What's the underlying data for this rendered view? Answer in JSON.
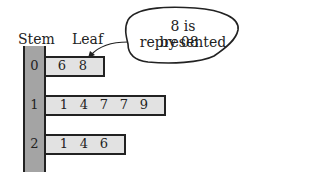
{
  "headers": {
    "stem": "Stem",
    "leaf": "Leaf"
  },
  "rows": [
    {
      "stem": "0",
      "leaves": [
        "6",
        "8"
      ]
    },
    {
      "stem": "1",
      "leaves": [
        "1",
        "4",
        "7",
        "7",
        "9"
      ]
    },
    {
      "stem": "2",
      "leaves": [
        "1",
        "4",
        "6"
      ]
    }
  ],
  "callout": {
    "line1": "8 is represented",
    "line2": "by 08"
  },
  "colors": {
    "stem_fill": "#a4a4a4",
    "leaf_fill": "#e2e2e2",
    "outline": "#222222"
  }
}
